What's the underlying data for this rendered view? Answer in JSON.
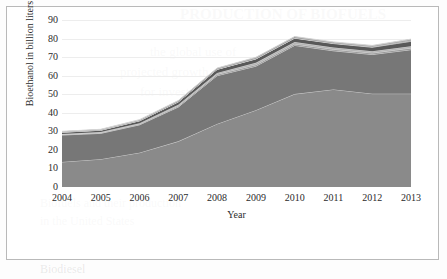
{
  "chart_data": {
    "type": "area",
    "stacked": true,
    "title": "",
    "xlabel": "Year",
    "ylabel": "Bioethanol in billion liters",
    "categories": [
      "2004",
      "2005",
      "2006",
      "2007",
      "2008",
      "2009",
      "2010",
      "2011",
      "2012",
      "2013"
    ],
    "x": [
      2004,
      2005,
      2006,
      2007,
      2008,
      2009,
      2010,
      2011,
      2012,
      2013
    ],
    "ylim": [
      0,
      90
    ],
    "ytick_values": [
      0,
      10,
      20,
      30,
      40,
      50,
      60,
      70,
      80,
      90
    ],
    "ytick_labels": [
      "0",
      "10",
      "20",
      "30",
      "40",
      "50",
      "60",
      "70",
      "80",
      "90"
    ],
    "grid": true,
    "legend_position": "bottom",
    "series": [
      {
        "name": "US",
        "color": "#8a8a8a",
        "values": [
          13.5,
          15.0,
          18.5,
          24.6,
          34.0,
          41.4,
          50.1,
          52.6,
          50.3,
          50.3
        ]
      },
      {
        "name": "Brazil",
        "color": "#777777",
        "values": [
          14.5,
          13.9,
          15.0,
          18.5,
          26.0,
          23.7,
          26.2,
          20.8,
          21.1,
          23.7
        ]
      },
      {
        "name": "Germany",
        "color": "#9c9c9c",
        "values": [
          0.3,
          0.4,
          0.5,
          0.6,
          0.7,
          0.8,
          0.8,
          0.8,
          0.8,
          0.9
        ]
      },
      {
        "name": "France",
        "color": "#b5b5b5",
        "values": [
          0.2,
          0.3,
          0.4,
          0.6,
          0.8,
          1.0,
          1.0,
          1.0,
          1.0,
          1.0
        ]
      },
      {
        "name": "China",
        "color": "#595959",
        "values": [
          1.0,
          1.0,
          1.3,
          1.6,
          1.9,
          2.1,
          2.1,
          2.1,
          2.1,
          2.6
        ]
      },
      {
        "name": "Argentina",
        "color": "#8f8f8f",
        "values": [
          0.0,
          0.0,
          0.0,
          0.0,
          0.0,
          0.1,
          0.1,
          0.2,
          0.3,
          0.5
        ]
      },
      {
        "name": "Italy",
        "color": "#4a4a4a",
        "values": [
          0.1,
          0.1,
          0.1,
          0.1,
          0.1,
          0.1,
          0.1,
          0.1,
          0.1,
          0.1
        ]
      },
      {
        "name": "Spain",
        "color": "#6e6e6e",
        "values": [
          0.3,
          0.3,
          0.4,
          0.4,
          0.4,
          0.5,
          0.5,
          0.4,
          0.4,
          0.4
        ]
      },
      {
        "name": "India",
        "color": "#7d7d7d",
        "values": [
          0.1,
          0.1,
          0.1,
          0.2,
          0.2,
          0.2,
          0.2,
          0.2,
          0.2,
          0.2
        ]
      }
    ],
    "totals": [
      30.0,
      31.1,
      36.3,
      46.6,
      64.1,
      69.9,
      81.1,
      78.2,
      76.3,
      79.7
    ],
    "annotations": []
  },
  "legend": {
    "items": [
      {
        "label": "US"
      },
      {
        "label": "Brazil"
      },
      {
        "label": "Germany"
      },
      {
        "label": "France"
      },
      {
        "label": "China"
      },
      {
        "label": "Argentina"
      },
      {
        "label": "Italy"
      },
      {
        "label": "Spain"
      },
      {
        "label": "India"
      }
    ]
  },
  "background_text": {
    "line1": "PRODUCTION OF BIOFUELS",
    "line2": "the global use of",
    "line3": "projected growth",
    "line4": "for investment",
    "line5": "Biofuels and their production",
    "line6": "in the United States",
    "line7": "Biodiesel"
  }
}
